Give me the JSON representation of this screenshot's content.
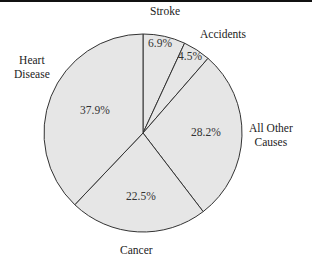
{
  "chart_data": {
    "type": "pie",
    "title": "",
    "start_angle_deg": 0,
    "direction": "clockwise",
    "slices": [
      {
        "label": "Stroke",
        "value": 6.9,
        "value_label": "6.9%"
      },
      {
        "label": "Accidents",
        "value": 4.5,
        "value_label": "4.5%"
      },
      {
        "label": "All Other Causes",
        "value": 28.2,
        "value_label": "28.2%"
      },
      {
        "label": "Cancer",
        "value": 22.5,
        "value_label": "22.5%"
      },
      {
        "label": "Heart Disease",
        "value": 37.9,
        "value_label": "37.9%"
      }
    ],
    "fill_color": "#e6e6e6",
    "edge_color": "#333333",
    "legend": "none"
  },
  "labels": {
    "stroke": "Stroke",
    "accidents": "Accidents",
    "other_line1": "All Other",
    "other_line2": "Causes",
    "cancer": "Cancer",
    "heart_line1": "Heart",
    "heart_line2": "Disease"
  },
  "pcts": {
    "stroke": "6.9%",
    "accidents": "4.5%",
    "other": "28.2%",
    "cancer": "22.5%",
    "heart": "37.9%"
  }
}
